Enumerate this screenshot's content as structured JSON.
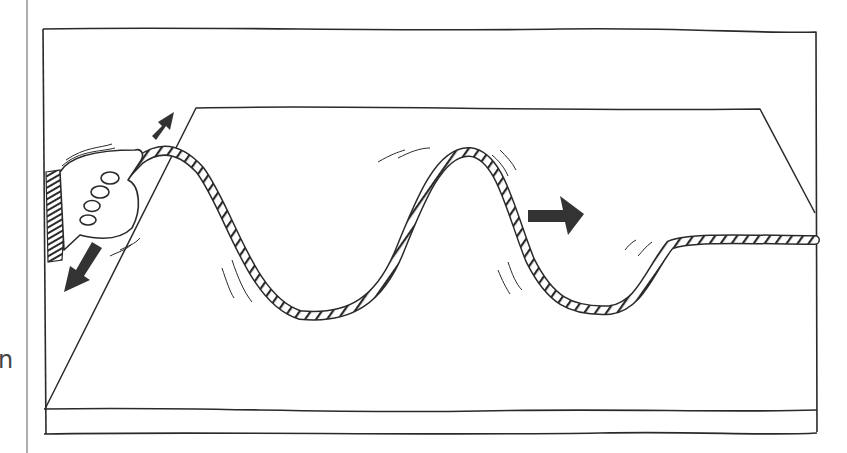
{
  "figure": {
    "margin_text_fragment": "n",
    "colors": {
      "ink": "#2a2a2a",
      "arrow": "#333333",
      "background": "#ffffff",
      "margin_text": "#444444"
    },
    "arrows": [
      {
        "name": "up-motion-arrow",
        "direction": "up-right"
      },
      {
        "name": "down-motion-arrow",
        "direction": "down-left"
      },
      {
        "name": "wave-direction-arrow",
        "direction": "right"
      }
    ],
    "elements": [
      "hand",
      "rope",
      "floor",
      "wall",
      "frame"
    ]
  }
}
